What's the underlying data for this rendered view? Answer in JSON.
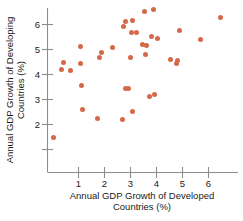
{
  "chart_data": {
    "type": "scatter",
    "title": "",
    "xlabel": "Annual GDP Growth of Developed Countries (%)",
    "xlabel_line1": "Annual GDP Growth of Developed",
    "xlabel_line2": "Countries (%)",
    "ylabel": "Annual GDP Growth of Developing Countries (%)",
    "ylabel_line1": "Annual GDP Growth of Developing",
    "ylabel_line2": "Countries (%)",
    "xlim": [
      -0.1,
      6.9
    ],
    "ylim": [
      1.1,
      6.8
    ],
    "xticks": [
      1,
      2,
      3,
      4,
      5,
      6
    ],
    "yticks": [
      2,
      3,
      4,
      5,
      6
    ],
    "xtick_labels": [
      "1",
      "2",
      "3",
      "4",
      "5",
      "6"
    ],
    "ytick_labels": [
      "2",
      "3",
      "4",
      "5",
      "6"
    ],
    "grid": false,
    "legend": false,
    "marker_color": "#d4694a",
    "axis_color": "#8c8c8c",
    "points": [
      {
        "x": 0.05,
        "y": 1.48
      },
      {
        "x": 0.33,
        "y": 4.22
      },
      {
        "x": 0.42,
        "y": 4.48
      },
      {
        "x": 0.68,
        "y": 4.16
      },
      {
        "x": 1.07,
        "y": 5.12
      },
      {
        "x": 1.08,
        "y": 4.44
      },
      {
        "x": 1.12,
        "y": 3.56
      },
      {
        "x": 1.14,
        "y": 2.6
      },
      {
        "x": 1.72,
        "y": 2.26
      },
      {
        "x": 1.79,
        "y": 4.67
      },
      {
        "x": 1.88,
        "y": 4.88
      },
      {
        "x": 2.3,
        "y": 5.08
      },
      {
        "x": 2.7,
        "y": 2.2
      },
      {
        "x": 2.72,
        "y": 5.92
      },
      {
        "x": 2.8,
        "y": 6.14
      },
      {
        "x": 2.82,
        "y": 3.44
      },
      {
        "x": 2.92,
        "y": 3.43
      },
      {
        "x": 3.0,
        "y": 4.68
      },
      {
        "x": 3.02,
        "y": 5.7
      },
      {
        "x": 3.06,
        "y": 2.53
      },
      {
        "x": 3.08,
        "y": 6.16
      },
      {
        "x": 3.22,
        "y": 5.7
      },
      {
        "x": 3.48,
        "y": 5.22
      },
      {
        "x": 3.52,
        "y": 6.52
      },
      {
        "x": 3.58,
        "y": 4.8
      },
      {
        "x": 3.6,
        "y": 5.17
      },
      {
        "x": 3.72,
        "y": 3.12
      },
      {
        "x": 3.8,
        "y": 5.52
      },
      {
        "x": 3.88,
        "y": 6.6
      },
      {
        "x": 3.92,
        "y": 3.2
      },
      {
        "x": 4.05,
        "y": 5.46
      },
      {
        "x": 4.52,
        "y": 4.6
      },
      {
        "x": 4.78,
        "y": 4.43
      },
      {
        "x": 4.82,
        "y": 4.57
      },
      {
        "x": 4.9,
        "y": 5.78
      },
      {
        "x": 5.68,
        "y": 5.4
      },
      {
        "x": 6.48,
        "y": 6.28
      }
    ]
  }
}
